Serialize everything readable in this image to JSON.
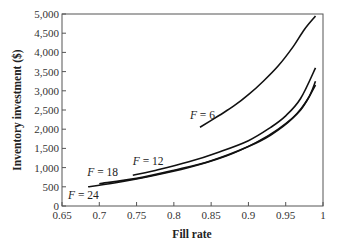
{
  "chart_data": {
    "type": "line",
    "title": "",
    "xlabel": "Fill rate",
    "ylabel": "Inventory investment ($)",
    "xlim": [
      0.65,
      1.0
    ],
    "ylim": [
      0,
      5000
    ],
    "xticks": [
      0.65,
      0.7,
      0.75,
      0.8,
      0.85,
      0.9,
      0.95,
      1
    ],
    "xtick_labels": [
      "0.65",
      "0.7",
      "0.75",
      "0.8",
      "0.85",
      "0.9",
      "0.95",
      "1"
    ],
    "yticks": [
      0,
      500,
      1000,
      1500,
      2000,
      2500,
      3000,
      3500,
      4000,
      4500,
      5000
    ],
    "ytick_labels": [
      "0",
      "500",
      "1,000",
      "1,500",
      "2,000",
      "2,500",
      "3,000",
      "3,500",
      "4,000",
      "4,500",
      "5,000"
    ],
    "grid": false,
    "legend": "inline curve labels",
    "series": [
      {
        "name": "F = 6",
        "label": "F = 6",
        "x": [
          0.835,
          0.86,
          0.88,
          0.9,
          0.92,
          0.94,
          0.96,
          0.975,
          0.99
        ],
        "y": [
          2050,
          2350,
          2600,
          2900,
          3250,
          3650,
          4150,
          4600,
          4950
        ]
      },
      {
        "name": "F = 12",
        "label": "F = 12",
        "x": [
          0.745,
          0.78,
          0.82,
          0.86,
          0.9,
          0.93,
          0.95,
          0.97,
          0.99
        ],
        "y": [
          800,
          950,
          1150,
          1400,
          1700,
          2050,
          2350,
          2800,
          3600
        ]
      },
      {
        "name": "F = 18",
        "label": "F = 18",
        "x": [
          0.7,
          0.75,
          0.8,
          0.85,
          0.9,
          0.93,
          0.96,
          0.98,
          0.99
        ],
        "y": [
          580,
          720,
          930,
          1180,
          1550,
          1850,
          2300,
          2800,
          3250
        ]
      },
      {
        "name": "F = 24",
        "label": "F = 24",
        "x": [
          0.685,
          0.72,
          0.77,
          0.82,
          0.87,
          0.91,
          0.94,
          0.97,
          0.99
        ],
        "y": [
          500,
          600,
          780,
          1000,
          1300,
          1650,
          2000,
          2500,
          3150
        ]
      }
    ]
  }
}
